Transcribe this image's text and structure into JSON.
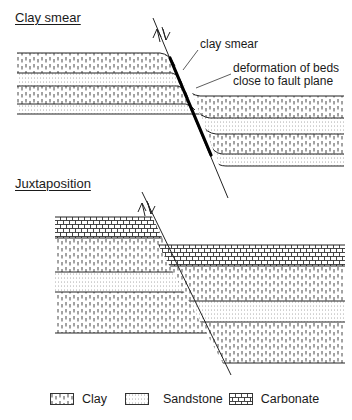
{
  "panels": [
    {
      "title": "Clay smear",
      "annotations": [
        {
          "id": "clay-smear",
          "text": "clay smear"
        },
        {
          "id": "deformation-line1",
          "text": "deformation of beds"
        },
        {
          "id": "deformation-line2",
          "text": "close to fault plane"
        }
      ]
    },
    {
      "title": "Juxtaposition"
    }
  ],
  "legend": {
    "items": [
      {
        "label": "Clay",
        "pattern": "clay"
      },
      {
        "label": "Sandstone",
        "pattern": "sandstone"
      },
      {
        "label": "Carbonate",
        "pattern": "carbonate"
      }
    ]
  },
  "colors": {
    "line": "#222222",
    "background": "#ffffff"
  }
}
